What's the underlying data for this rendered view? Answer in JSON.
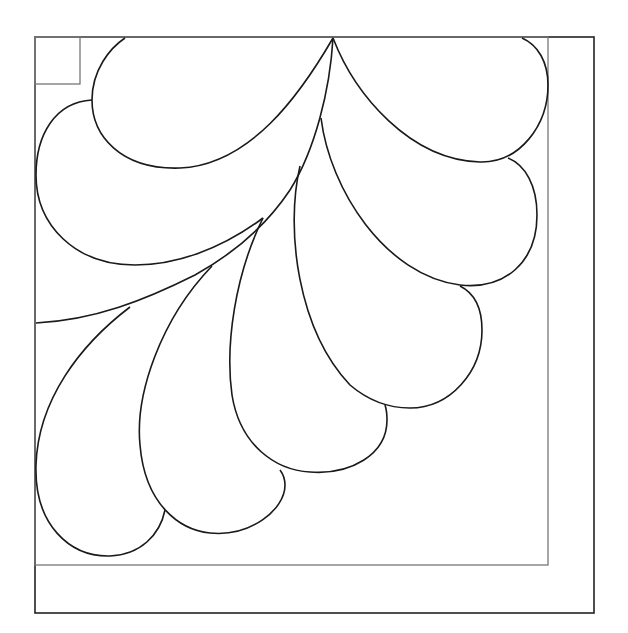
{
  "colors": {
    "background": "#ffffff",
    "feather_stroke": "#1a1a1a",
    "outer_frame_stroke": "#222222",
    "inner_frame_stroke": "#777777",
    "corner_square_stroke": "#777777"
  },
  "frames": {
    "outer": {
      "x": 35,
      "y": 37,
      "width": 559,
      "height": 576
    },
    "inner": {
      "x": 35,
      "y": 37,
      "width": 513,
      "height": 528
    },
    "corner_square": {
      "x": 35,
      "y": 37,
      "width": 45,
      "height": 47
    }
  },
  "feathers": [
    {
      "id": "feather-top-left",
      "d": "M333,38 C300,95 250,165 180,168 C120,170 92,135 92,100 C92,70 110,48 125,38"
    },
    {
      "id": "feather-left",
      "d": "M263,218 C220,250 175,265 135,265 C75,265 36,225 36,175 C36,135 55,102 92,100"
    },
    {
      "id": "feather-top-right",
      "d": "M333,38 C355,95 410,160 480,162 C520,163 548,125 548,85 C548,62 538,45 522,38"
    },
    {
      "id": "feather-right",
      "d": "M321,118 C330,190 385,275 460,285 C505,290 537,262 537,215 C537,185 525,165 508,158"
    },
    {
      "id": "feather-right-lower",
      "d": "M300,166 C285,230 298,330 350,385 C370,402 390,408 410,408 C450,408 482,372 482,330 C482,305 472,292 460,286"
    },
    {
      "id": "feather-bottom-middle",
      "d": "M263,218 C235,275 225,345 232,395 C240,445 275,470 310,472 C350,475 387,455 387,420 C387,412 386,408 385,405"
    },
    {
      "id": "feather-bottom",
      "d": "M212,266 C160,320 135,395 140,445 C145,505 180,530 210,533 C250,537 285,510 285,485 C285,478 283,474 280,470"
    },
    {
      "id": "feather-bottom-left",
      "d": "M130,307 C80,345 38,400 36,465 C34,525 70,557 110,556 C140,555 160,535 165,510"
    }
  ],
  "spine": {
    "id": "central-spine",
    "d": "M333,38 C330,90 315,150 290,190 C270,220 240,250 195,275 C145,300 95,320 36,323"
  },
  "spine_branch_points": [
    {
      "x": 321,
      "y": 118
    },
    {
      "x": 300,
      "y": 166
    },
    {
      "x": 263,
      "y": 218
    },
    {
      "x": 212,
      "y": 266
    },
    {
      "x": 130,
      "y": 307
    }
  ]
}
